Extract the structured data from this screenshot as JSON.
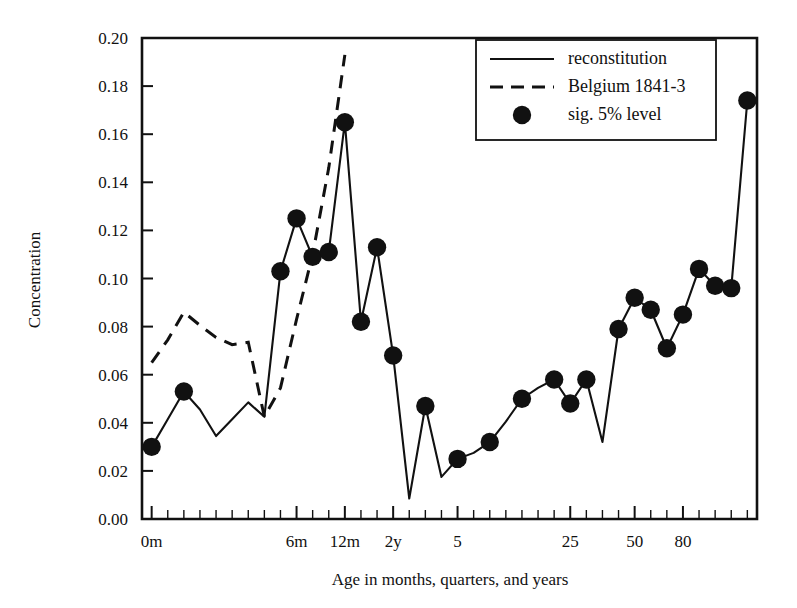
{
  "chart_data": {
    "type": "line",
    "title": "",
    "xlabel": "Age in months, quarters, and years",
    "ylabel": "Concentration",
    "ylim": [
      0.0,
      0.2
    ],
    "ytick_labels": [
      "0.00",
      "0.02",
      "0.04",
      "0.06",
      "0.08",
      "0.10",
      "0.12",
      "0.14",
      "0.16",
      "0.18",
      "0.20"
    ],
    "ytick_values": [
      0.0,
      0.02,
      0.04,
      0.06,
      0.08,
      0.1,
      0.12,
      0.14,
      0.16,
      0.18,
      0.2
    ],
    "xtick_labels": [
      "0m",
      "6m",
      "12m",
      "2y",
      "5",
      "25",
      "50",
      "80"
    ],
    "xtick_label_positions": [
      0,
      9,
      12,
      15,
      19,
      26,
      30,
      33
    ],
    "grid": false,
    "legend_position": "top-right",
    "legend": [
      {
        "label": "reconstitution",
        "marker": "solid-line"
      },
      {
        "label": "Belgium 1841-3",
        "marker": "dashed-line"
      },
      {
        "label": "sig. 5% level",
        "marker": "filled-circle"
      }
    ],
    "series": [
      {
        "name": "reconstitution",
        "style": "solid",
        "x": [
          0,
          1,
          2,
          3,
          4,
          5,
          6,
          7,
          8,
          9,
          10,
          11,
          12,
          13,
          14,
          15,
          16,
          17,
          18,
          19,
          20,
          21,
          22,
          23,
          24,
          25,
          26,
          27,
          28,
          29,
          30,
          31,
          32,
          33
        ],
        "values": [
          0.03,
          0.0415,
          0.053,
          0.0455,
          0.0345,
          0.0415,
          0.0485,
          0.0425,
          0.103,
          0.125,
          0.109,
          0.111,
          0.165,
          0.082,
          0.113,
          0.068,
          0.0085,
          0.047,
          0.0175,
          0.025,
          0.0275,
          0.032,
          0.0405,
          0.05,
          0.0545,
          0.058,
          0.048,
          0.058,
          0.032,
          0.079,
          0.092,
          0.087,
          0.071,
          0.085
        ]
      },
      {
        "name": "reconstitution-tail",
        "style": "solid",
        "x": [
          33,
          34,
          35,
          36,
          37
        ],
        "values": [
          0.085,
          0.104,
          0.097,
          0.096,
          0.174
        ]
      },
      {
        "name": "Belgium 1841-3",
        "style": "dashed",
        "x": [
          0,
          1,
          2,
          3,
          4,
          5,
          6,
          7,
          8,
          9,
          10,
          11,
          12
        ],
        "values": [
          0.065,
          0.0745,
          0.086,
          0.0805,
          0.0755,
          0.0725,
          0.0735,
          0.0425,
          0.0545,
          0.083,
          0.11,
          0.146,
          0.193
        ]
      }
    ],
    "significant_points": {
      "marker": "filled-circle",
      "x": [
        0,
        2,
        8,
        9,
        10,
        11,
        12,
        13,
        14,
        15,
        17,
        19,
        21,
        23,
        25,
        26,
        27,
        29,
        30,
        31,
        32,
        33,
        34,
        35,
        36,
        37
      ],
      "values": [
        0.03,
        0.053,
        0.103,
        0.125,
        0.109,
        0.111,
        0.165,
        0.082,
        0.113,
        0.068,
        0.047,
        0.025,
        0.032,
        0.05,
        0.058,
        0.048,
        0.058,
        0.079,
        0.092,
        0.087,
        0.071,
        0.085,
        0.104,
        0.097,
        0.096,
        0.174
      ]
    },
    "colors": {
      "line": "#111111",
      "marker": "#111111",
      "background": "#ffffff"
    }
  }
}
